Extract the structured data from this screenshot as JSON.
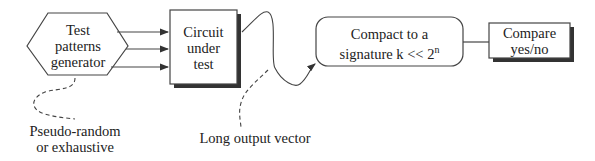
{
  "diagram": {
    "nodes": {
      "generator": {
        "line1": "Test",
        "line2": "patterns",
        "line3": "generator"
      },
      "circuit": {
        "line1": "Circuit",
        "line2": "under",
        "line3": "test"
      },
      "compact": {
        "line1": "Compact to a",
        "line2": "signature k << 2",
        "sup": "n"
      },
      "compare": {
        "line1": "Compare",
        "line2": "yes/no"
      }
    },
    "annotations": {
      "generator_note": {
        "line1": "Pseudo-random",
        "line2": "or exhaustive"
      },
      "output_note": "Long output vector"
    },
    "edges": [
      {
        "from": "generator",
        "to": "circuit",
        "count": 3
      },
      {
        "from": "circuit",
        "to": "compact",
        "style": "curved"
      },
      {
        "from": "compact",
        "to": "compare",
        "style": "line"
      }
    ]
  }
}
